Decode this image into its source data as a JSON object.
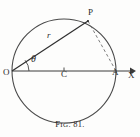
{
  "figure": {
    "caption_prefix": "F",
    "caption_smallcaps": "IG",
    "caption_number": ". 81.",
    "caption_full": "FIG. 81."
  },
  "labels": {
    "point_p": "P",
    "point_o": "O",
    "point_c": "C",
    "point_a": "A",
    "axis_x": "X",
    "radius": "r",
    "angle": "θ"
  },
  "colors": {
    "ink": "#2b2b2b",
    "line": "#3a3a3a",
    "circle": "#4a4a4a",
    "dashed": "#6e6e6e",
    "background": "#fdfdfc"
  },
  "geometry": {
    "circle_center_x": 64,
    "circle_center_y": 71,
    "circle_radius": 52,
    "point_o_x": 12,
    "point_o_y": 71,
    "point_a_x": 116,
    "point_a_y": 71,
    "point_c_x": 64,
    "point_c_y": 71,
    "point_p_x": 88,
    "point_p_y": 21,
    "axis_end_x": 134,
    "angle_arc_radius": 17
  }
}
